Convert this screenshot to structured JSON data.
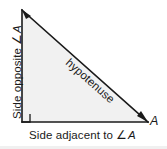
{
  "figure": {
    "background_color": "#ffffff",
    "stroke_color": "#1a1a1a",
    "fill_color": "#f1f1f1",
    "text_color": "#1a1a1a"
  },
  "labels": {
    "side_opposite": "Side opposite ∠A",
    "side_opposite_text": "Side opposite ",
    "side_opposite_angle": "∠",
    "side_opposite_vertex": "A",
    "hypotenuse": "hypotenuse",
    "side_adjacent": "Side adjacent to ∠A",
    "side_adjacent_text": "Side adjacent to ",
    "side_adjacent_angle": "∠",
    "side_adjacent_vertex": "A",
    "vertex_a": "A"
  },
  "geometry": {
    "type": "right-triangle",
    "vertices": {
      "top": [
        22,
        10
      ],
      "right_angle": [
        22,
        122
      ],
      "angle_a": [
        148,
        122
      ]
    },
    "right_angle_marker_size": 8,
    "arrowheads": [
      "top",
      "right"
    ]
  }
}
